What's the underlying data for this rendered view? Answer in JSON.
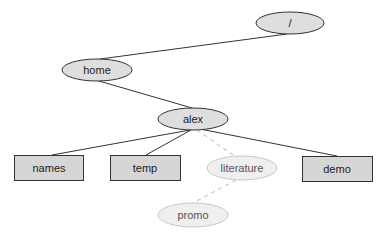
{
  "diagram": {
    "type": "directory-tree",
    "nodes": [
      {
        "id": "root",
        "label": "/",
        "shape": "ellipse",
        "faded": false,
        "cx": 290,
        "cy": 23,
        "rx": 34,
        "ry": 11
      },
      {
        "id": "home",
        "label": "home",
        "shape": "ellipse",
        "faded": false,
        "cx": 97,
        "cy": 70,
        "rx": 35,
        "ry": 11
      },
      {
        "id": "alex",
        "label": "alex",
        "shape": "ellipse",
        "faded": false,
        "cx": 193,
        "cy": 119,
        "rx": 35,
        "ry": 11
      },
      {
        "id": "names",
        "label": "names",
        "shape": "rect",
        "faded": false,
        "x": 14,
        "y": 155,
        "w": 69,
        "h": 25
      },
      {
        "id": "temp",
        "label": "temp",
        "shape": "rect",
        "faded": false,
        "x": 110,
        "y": 155,
        "w": 70,
        "h": 25
      },
      {
        "id": "literature",
        "label": "literature",
        "shape": "ellipse",
        "faded": true,
        "cx": 242,
        "cy": 168,
        "rx": 35,
        "ry": 12
      },
      {
        "id": "demo",
        "label": "demo",
        "shape": "rect",
        "faded": false,
        "x": 302,
        "y": 156,
        "w": 70,
        "h": 25
      },
      {
        "id": "promo",
        "label": "promo",
        "shape": "ellipse",
        "faded": true,
        "cx": 193,
        "cy": 215,
        "rx": 35,
        "ry": 12
      }
    ],
    "edges": [
      {
        "from": "root",
        "to": "home",
        "dashed": false
      },
      {
        "from": "home",
        "to": "alex",
        "dashed": false
      },
      {
        "from": "alex",
        "to": "names",
        "dashed": false
      },
      {
        "from": "alex",
        "to": "temp",
        "dashed": false
      },
      {
        "from": "alex",
        "to": "literature",
        "dashed": true
      },
      {
        "from": "alex",
        "to": "demo",
        "dashed": false
      },
      {
        "from": "literature",
        "to": "promo",
        "dashed": true
      }
    ],
    "colors": {
      "ellipse_fill": "#dedede",
      "rect_fill": "#d6d6d6",
      "stroke": "#333333",
      "faded_fill": "#efefef",
      "faded_stroke": "#c8c8c8"
    }
  }
}
